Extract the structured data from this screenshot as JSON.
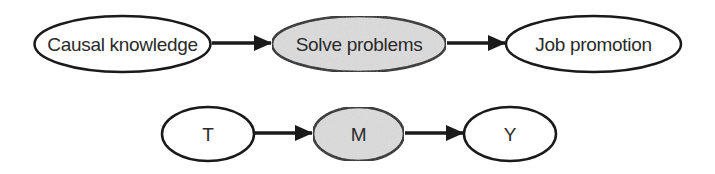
{
  "diagram": {
    "type": "causal-dag",
    "colors": {
      "stroke": "#1a1a1a",
      "node_fill": "#ffffff",
      "mediator_fill": "#dcdcdc",
      "text": "#2a2a2a"
    },
    "rows": [
      {
        "nodes": [
          {
            "id": "causal-knowledge",
            "label": "Causal knowledge",
            "role": "treatment",
            "shaded": false
          },
          {
            "id": "solve-problems",
            "label": "Solve problems",
            "role": "mediator",
            "shaded": true
          },
          {
            "id": "job-promotion",
            "label": "Job promotion",
            "role": "outcome",
            "shaded": false
          }
        ],
        "edges": [
          {
            "from": "causal-knowledge",
            "to": "solve-problems"
          },
          {
            "from": "solve-problems",
            "to": "job-promotion"
          }
        ]
      },
      {
        "nodes": [
          {
            "id": "T",
            "label": "T",
            "role": "treatment",
            "shaded": false
          },
          {
            "id": "M",
            "label": "M",
            "role": "mediator",
            "shaded": true
          },
          {
            "id": "Y",
            "label": "Y",
            "role": "outcome",
            "shaded": false
          }
        ],
        "edges": [
          {
            "from": "T",
            "to": "M"
          },
          {
            "from": "M",
            "to": "Y"
          }
        ]
      }
    ]
  }
}
